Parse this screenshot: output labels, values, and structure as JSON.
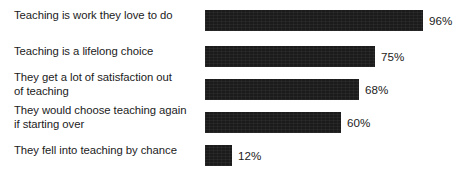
{
  "chart_data": {
    "type": "bar",
    "orientation": "horizontal",
    "title": "",
    "subtitle": "",
    "xlabel": "",
    "ylabel": "",
    "xlim": [
      0,
      100
    ],
    "grid": false,
    "legend": null,
    "value_suffix": "%",
    "bar_color": "#1c1b1b",
    "background_color": "#ffffff",
    "text_color": "#1b1b1b",
    "categories": [
      "Teaching is work they love to do",
      "Teaching is a lifelong choice",
      "They get a lot of satisfaction out of teaching",
      "They would choose teaching again if starting over",
      "They fell into teaching by chance"
    ],
    "values": [
      96,
      75,
      68,
      60,
      12
    ],
    "data_labels": [
      "96%",
      "75%",
      "68%",
      "60%",
      "12%"
    ],
    "bars": [
      {
        "label_lines": "Teaching is work they love to do",
        "label_line_count": 1,
        "value": 96,
        "data_label": "96%"
      },
      {
        "label_lines": "Teaching is a lifelong choice",
        "label_line_count": 1,
        "value": 75,
        "data_label": "75%"
      },
      {
        "label_lines": "They get a lot of satisfaction out\nof teaching",
        "label_line_count": 2,
        "value": 68,
        "data_label": "68%"
      },
      {
        "label_lines": "They would choose teaching again\nif starting over",
        "label_line_count": 2,
        "value": 60,
        "data_label": "60%"
      },
      {
        "label_lines": "They fell into teaching by chance",
        "label_line_count": 1,
        "value": 12,
        "data_label": "12%"
      }
    ]
  }
}
